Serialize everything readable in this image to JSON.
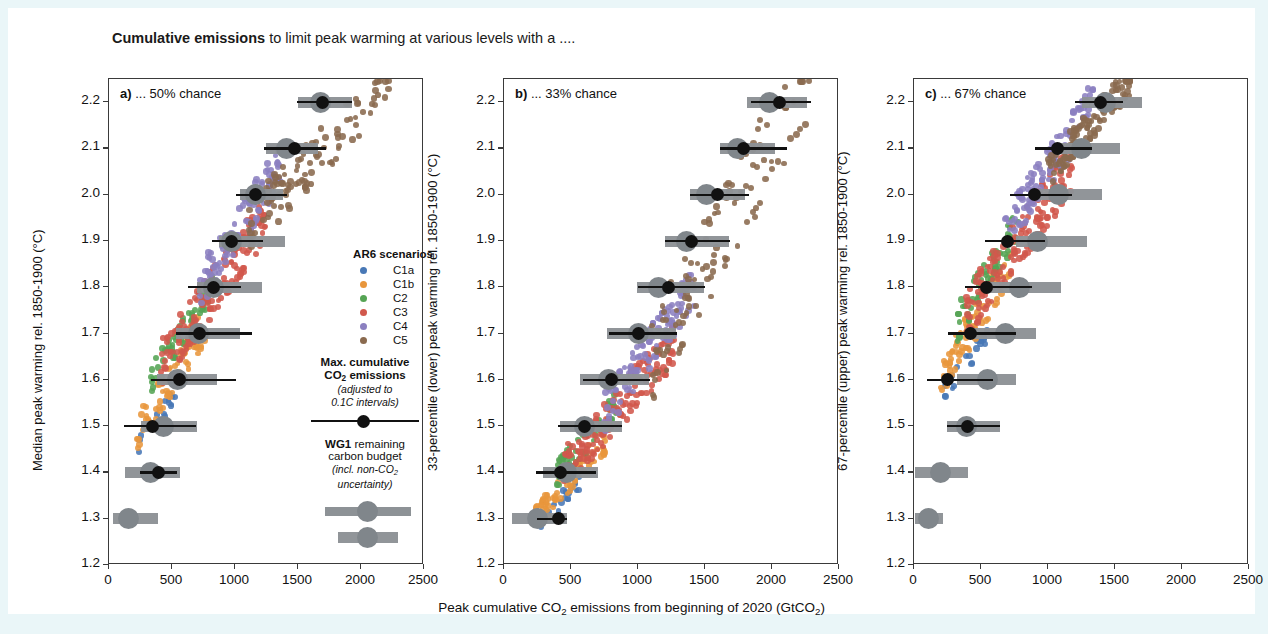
{
  "figure": {
    "title_bold": "Cumulative emissions",
    "title_rest": " to limit peak warming at various levels with a ....",
    "xaxis_title_parts": [
      "Peak cumulative CO",
      "2",
      " emissions from beginning of 2020 (GtCO",
      "2",
      ")"
    ]
  },
  "legend": {
    "scenarios_header": "AR6 scenarios",
    "items": [
      {
        "label": "C1a",
        "color": "#4878b6"
      },
      {
        "label": "C1b",
        "color": "#e8963c"
      },
      {
        "label": "C2",
        "color": "#55a454"
      },
      {
        "label": "C3",
        "color": "#d1584c"
      },
      {
        "label": "C4",
        "color": "#8b80c0"
      },
      {
        "label": "C5",
        "color": "#8a6a4f"
      }
    ],
    "max_cum_title_l1": "Max. cumulative",
    "max_cum_title_l2_a": "CO",
    "max_cum_title_l2_sub": "2",
    "max_cum_title_l2_b": " emissions",
    "max_cum_sub_l1": "(adjusted to",
    "max_cum_sub_l2": "0.1C intervals)",
    "wg1_bold": "WG1",
    "wg1_rest": " remaining",
    "wg1_l2": "carbon budget",
    "wg1_sub_l1_a": "(incl. non-CO",
    "wg1_sub_l1_sub": "2",
    "wg1_sub_l2": "uncertainty)",
    "band_color": "#8d9296",
    "wg1_color": "#111111"
  },
  "chart_data": {
    "type": "scatter",
    "title": "Cumulative emissions to limit peak warming at various levels with a ....",
    "xlabel": "Peak cumulative CO2 emissions from beginning of 2020 (GtCO2)",
    "xlim": [
      0,
      2500
    ],
    "ylim": [
      1.2,
      2.25
    ],
    "xticks": [
      0,
      500,
      1000,
      1500,
      2000,
      2500
    ],
    "yticks": [
      1.2,
      1.3,
      1.4,
      1.5,
      1.6,
      1.7,
      1.8,
      1.9,
      2.0,
      2.1,
      2.2
    ],
    "grid": false,
    "legend_position": "inside-panel-a-right",
    "series_colors": {
      "C1a": "#4878b6",
      "C1b": "#e8963c",
      "C2": "#55a454",
      "C3": "#d1584c",
      "C4": "#8b80c0",
      "C5": "#8a6a4f"
    },
    "panels": [
      {
        "key": "a",
        "label_bold": "a)",
        "label_rest": " ... 50% chance",
        "ylabel": "Median peak warming rel. 1850-1900 (°C)",
        "max_cum_bands": [
          {
            "warming": 1.26,
            "x_lo": 1820,
            "x_hi": 2290,
            "center": 2055
          },
          {
            "warming": 1.3,
            "x_lo": 30,
            "x_hi": 390,
            "center": 155
          },
          {
            "warming": 1.4,
            "x_lo": 125,
            "x_hi": 560,
            "center": 330
          },
          {
            "warming": 1.5,
            "x_lo": 250,
            "x_hi": 700,
            "center": 430
          },
          {
            "warming": 1.6,
            "x_lo": 380,
            "x_hi": 860,
            "center": 545
          },
          {
            "warming": 1.7,
            "x_lo": 530,
            "x_hi": 1040,
            "center": 710
          },
          {
            "warming": 1.8,
            "x_lo": 700,
            "x_hi": 1215,
            "center": 830
          },
          {
            "warming": 1.9,
            "x_lo": 870,
            "x_hi": 1400,
            "center": 975
          },
          {
            "warming": 2.0,
            "x_lo": 1040,
            "x_hi": 1380,
            "center": 1165
          },
          {
            "warming": 2.1,
            "x_lo": 1245,
            "x_hi": 1660,
            "center": 1405
          },
          {
            "warming": 2.2,
            "x_lo": 1500,
            "x_hi": 1930,
            "center": 1680
          }
        ],
        "wg1_budgets": [
          {
            "warming": 1.4,
            "x": 390,
            "lo": 245,
            "hi": 540
          },
          {
            "warming": 1.5,
            "x": 345,
            "lo": 120,
            "hi": 690
          },
          {
            "warming": 1.6,
            "x": 560,
            "lo": 330,
            "hi": 1010
          },
          {
            "warming": 1.7,
            "x": 720,
            "lo": 530,
            "hi": 1135
          },
          {
            "warming": 1.8,
            "x": 830,
            "lo": 630,
            "hi": 1050
          },
          {
            "warming": 1.9,
            "x": 975,
            "lo": 815,
            "hi": 1225
          },
          {
            "warming": 2.0,
            "x": 1160,
            "lo": 1010,
            "hi": 1410
          },
          {
            "warming": 2.1,
            "x": 1475,
            "lo": 1230,
            "hi": 1720
          },
          {
            "warming": 2.2,
            "x": 1695,
            "lo": 1490,
            "hi": 1930
          }
        ],
        "scatter_cloud": {
          "note": "AR6 scenario ensemble, median peak warming vs peak cumulative CO2",
          "groups": [
            {
              "name": "C1a",
              "n": 22,
              "x_range": [
                230,
                560
              ],
              "y_range": [
                1.46,
                1.58
              ],
              "slope": 0.00055
            },
            {
              "name": "C1b",
              "n": 70,
              "x_range": [
                210,
                760
              ],
              "y_range": [
                1.48,
                1.72
              ],
              "slope": 0.00055
            },
            {
              "name": "C2",
              "n": 60,
              "x_range": [
                330,
                820
              ],
              "y_range": [
                1.6,
                1.8
              ],
              "slope": 0.00055
            },
            {
              "name": "C3",
              "n": 150,
              "x_range": [
                400,
                1250
              ],
              "y_range": [
                1.63,
                1.95
              ],
              "slope": 0.00055
            },
            {
              "name": "C4",
              "n": 110,
              "x_range": [
                720,
                1400
              ],
              "y_range": [
                1.8,
                2.08
              ],
              "slope": 0.00055
            },
            {
              "name": "C5",
              "n": 110,
              "x_range": [
                1080,
                2220
              ],
              "y_range": [
                1.92,
                2.25
              ],
              "slope": 0.0005
            }
          ]
        }
      },
      {
        "key": "b",
        "label_bold": "b)",
        "label_rest": " ... 33% chance",
        "ylabel": "33-percentile (lower) peak warming rel. 1850-1900 (°C)",
        "max_cum_bands": [
          {
            "warming": 1.3,
            "x_lo": 60,
            "x_hi": 470,
            "center": 250
          },
          {
            "warming": 1.4,
            "x_lo": 290,
            "x_hi": 700,
            "center": 465
          },
          {
            "warming": 1.5,
            "x_lo": 420,
            "x_hi": 880,
            "center": 600
          },
          {
            "warming": 1.6,
            "x_lo": 570,
            "x_hi": 1085,
            "center": 780
          },
          {
            "warming": 1.7,
            "x_lo": 770,
            "x_hi": 1285,
            "center": 1000
          },
          {
            "warming": 1.8,
            "x_lo": 990,
            "x_hi": 1490,
            "center": 1150
          },
          {
            "warming": 1.9,
            "x_lo": 1200,
            "x_hi": 1680,
            "center": 1360
          },
          {
            "warming": 2.0,
            "x_lo": 1390,
            "x_hi": 1800,
            "center": 1510
          },
          {
            "warming": 2.1,
            "x_lo": 1610,
            "x_hi": 2020,
            "center": 1745
          },
          {
            "warming": 2.2,
            "x_lo": 1810,
            "x_hi": 2260,
            "center": 1980
          }
        ],
        "wg1_budgets": [
          {
            "warming": 1.3,
            "x": 410,
            "lo": 245,
            "hi": 470
          },
          {
            "warming": 1.4,
            "x": 420,
            "lo": 240,
            "hi": 690
          },
          {
            "warming": 1.5,
            "x": 600,
            "lo": 400,
            "hi": 880
          },
          {
            "warming": 1.6,
            "x": 800,
            "lo": 590,
            "hi": 1090
          },
          {
            "warming": 1.7,
            "x": 1000,
            "lo": 780,
            "hi": 1290
          },
          {
            "warming": 1.8,
            "x": 1230,
            "lo": 1000,
            "hi": 1500
          },
          {
            "warming": 1.9,
            "x": 1400,
            "lo": 1200,
            "hi": 1690
          },
          {
            "warming": 2.0,
            "x": 1590,
            "lo": 1390,
            "hi": 1830
          },
          {
            "warming": 2.1,
            "x": 1790,
            "lo": 1610,
            "hi": 2110
          },
          {
            "warming": 2.2,
            "x": 2055,
            "lo": 1840,
            "hi": 2290
          }
        ],
        "scatter_cloud": {
          "note": "AR6 scenario ensemble, 33-percentile peak warming vs peak cumulative CO2",
          "groups": [
            {
              "name": "C1a",
              "n": 22,
              "x_range": [
                230,
                560
              ],
              "y_range": [
                1.28,
                1.38
              ],
              "slope": 0.00045
            },
            {
              "name": "C1b",
              "n": 70,
              "x_range": [
                210,
                760
              ],
              "y_range": [
                1.29,
                1.47
              ],
              "slope": 0.00045
            },
            {
              "name": "C2",
              "n": 60,
              "x_range": [
                350,
                850
              ],
              "y_range": [
                1.38,
                1.55
              ],
              "slope": 0.00045
            },
            {
              "name": "C3",
              "n": 150,
              "x_range": [
                430,
                1280
              ],
              "y_range": [
                1.4,
                1.68
              ],
              "slope": 0.00045
            },
            {
              "name": "C4",
              "n": 110,
              "x_range": [
                740,
                1420
              ],
              "y_range": [
                1.53,
                1.8
              ],
              "slope": 0.00045
            },
            {
              "name": "C5",
              "n": 110,
              "x_range": [
                1100,
                2280
              ],
              "y_range": [
                1.65,
                2.25
              ],
              "slope": 0.00048
            }
          ]
        }
      },
      {
        "key": "c",
        "label_bold": "c)",
        "label_rest": " ... 67% chance",
        "ylabel": "67-percentile (upper) peak warming rel. 1850-1900 (°C)",
        "max_cum_bands": [
          {
            "warming": 1.3,
            "x_lo": 10,
            "x_hi": 220,
            "center": 105
          },
          {
            "warming": 1.4,
            "x_lo": 10,
            "x_hi": 405,
            "center": 195
          },
          {
            "warming": 1.5,
            "x_lo": 245,
            "x_hi": 640,
            "center": 395
          },
          {
            "warming": 1.6,
            "x_lo": 320,
            "x_hi": 760,
            "center": 545
          },
          {
            "warming": 1.7,
            "x_lo": 390,
            "x_hi": 910,
            "center": 680
          },
          {
            "warming": 1.8,
            "x_lo": 570,
            "x_hi": 1095,
            "center": 785
          },
          {
            "warming": 1.9,
            "x_lo": 760,
            "x_hi": 1290,
            "center": 925
          },
          {
            "warming": 2.0,
            "x_lo": 930,
            "x_hi": 1400,
            "center": 1080
          },
          {
            "warming": 2.1,
            "x_lo": 1080,
            "x_hi": 1540,
            "center": 1250
          },
          {
            "warming": 2.2,
            "x_lo": 1250,
            "x_hi": 1700,
            "center": 1430
          }
        ],
        "wg1_budgets": [
          {
            "warming": 1.5,
            "x": 400,
            "lo": 245,
            "hi": 640
          },
          {
            "warming": 1.6,
            "x": 250,
            "lo": 100,
            "hi": 590
          },
          {
            "warming": 1.7,
            "x": 420,
            "lo": 255,
            "hi": 760
          },
          {
            "warming": 1.8,
            "x": 540,
            "lo": 380,
            "hi": 880
          },
          {
            "warming": 1.9,
            "x": 700,
            "lo": 530,
            "hi": 980
          },
          {
            "warming": 2.0,
            "x": 900,
            "lo": 720,
            "hi": 1180
          },
          {
            "warming": 2.1,
            "x": 1070,
            "lo": 900,
            "hi": 1330
          },
          {
            "warming": 2.2,
            "x": 1390,
            "lo": 1200,
            "hi": 1560
          }
        ],
        "scatter_cloud": {
          "note": "AR6 scenario ensemble, 67-percentile peak warming vs peak cumulative CO2",
          "groups": [
            {
              "name": "C1a",
              "n": 22,
              "x_range": [
                230,
                560
              ],
              "y_range": [
                1.58,
                1.7
              ],
              "slope": 0.0006
            },
            {
              "name": "C1b",
              "n": 70,
              "x_range": [
                200,
                730
              ],
              "y_range": [
                1.6,
                1.86
              ],
              "slope": 0.0006
            },
            {
              "name": "C2",
              "n": 60,
              "x_range": [
                320,
                800
              ],
              "y_range": [
                1.72,
                1.95
              ],
              "slope": 0.0006
            },
            {
              "name": "C3",
              "n": 150,
              "x_range": [
                380,
                1180
              ],
              "y_range": [
                1.74,
                2.06
              ],
              "slope": 0.0006
            },
            {
              "name": "C4",
              "n": 110,
              "x_range": [
                680,
                1340
              ],
              "y_range": [
                1.92,
                2.2
              ],
              "slope": 0.0006
            },
            {
              "name": "C5",
              "n": 110,
              "x_range": [
                1000,
                1620
              ],
              "y_range": [
                2.05,
                2.25
              ],
              "slope": 0.00055
            }
          ]
        }
      }
    ]
  }
}
